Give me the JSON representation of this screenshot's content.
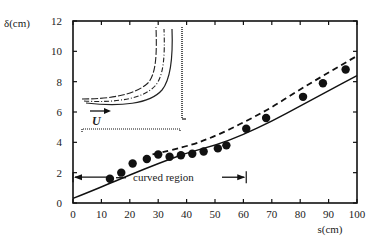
{
  "chart_data": {
    "type": "scatter",
    "title": "",
    "xlabel": "s(cm)",
    "ylabel": "δ(cm)",
    "xlim": [
      0,
      100
    ],
    "ylim": [
      0,
      12
    ],
    "xticks": [
      0,
      10,
      20,
      30,
      40,
      50,
      60,
      70,
      80,
      90,
      100
    ],
    "yticks": [
      0,
      2,
      4,
      6,
      8,
      10,
      12
    ],
    "grid": false,
    "series": [
      {
        "name": "measured",
        "style": "filled-circle",
        "x": [
          13,
          17,
          21,
          26,
          30,
          34,
          38,
          42,
          46,
          51,
          54,
          61,
          68,
          81,
          88,
          96
        ],
        "y": [
          1.6,
          2.0,
          2.6,
          2.9,
          3.2,
          3.05,
          3.15,
          3.25,
          3.4,
          3.6,
          3.8,
          4.9,
          5.6,
          7.0,
          7.9,
          8.8
        ]
      },
      {
        "name": "solid-curve",
        "style": "solid-line",
        "x": [
          0,
          10,
          20,
          30,
          40,
          50,
          60,
          70,
          80,
          90,
          100
        ],
        "y": [
          0.3,
          1.05,
          1.85,
          2.6,
          3.3,
          3.8,
          4.5,
          5.4,
          6.4,
          7.4,
          8.4
        ]
      },
      {
        "name": "dashed-curve",
        "style": "dashed-line",
        "x": [
          28,
          40,
          50,
          60,
          70,
          80,
          90,
          100
        ],
        "y": [
          3.2,
          3.7,
          4.4,
          5.3,
          6.3,
          7.5,
          8.6,
          9.7
        ]
      }
    ],
    "annotations": [
      {
        "text": "curved region",
        "x_start": 0,
        "x_end": 61,
        "y": 1.7,
        "type": "double-arrow-span"
      },
      {
        "text": "U",
        "type": "inset-flow-arrow"
      }
    ],
    "inset": {
      "description": "schematic of curved channel with three boundary-layer contour lines and flow arrow U"
    }
  }
}
